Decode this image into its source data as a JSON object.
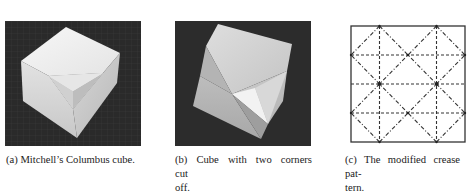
{
  "figure": {
    "subfigures": [
      {
        "label": "(a)",
        "caption": "(a) Mitchell’s Columbus cube.",
        "content": "photo of white paper cube with one corner inverted on dark background"
      },
      {
        "label": "(b)",
        "caption_line1": "(b) Cube with two corners cut",
        "caption_line2": "off.",
        "content": "photo of white paper cube with two corners cut off on dark background"
      },
      {
        "label": "(c)",
        "caption_line1": "(c) The modified crease pat-",
        "caption_line2": "tern.",
        "content": "square crease pattern diagram",
        "legend": {
          "dashed": "valley fold",
          "dash_dot": "mountain fold"
        }
      }
    ]
  },
  "colors": {
    "photo_background": "#2b2b2b",
    "paper_light": "#f2f2f2",
    "line": "#333333"
  }
}
